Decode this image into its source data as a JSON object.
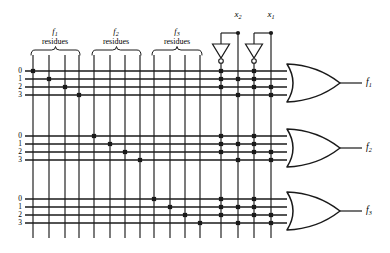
{
  "diagram": {
    "type": "logic-diagram",
    "width": 390,
    "height": 253,
    "line_color": "#1a1a1a",
    "background": "#ffffff"
  },
  "column_groups": [
    {
      "id": "f1-residues",
      "func_label": "f",
      "func_sub": "1",
      "caption": "residues",
      "brace_x1": 31,
      "brace_x2": 80,
      "label_cx": 55,
      "columns": [
        33,
        49,
        65,
        79
      ]
    },
    {
      "id": "f2-residues",
      "func_label": "f",
      "func_sub": "2",
      "caption": "residues",
      "brace_x1": 92,
      "brace_x2": 141,
      "label_cx": 116,
      "columns": [
        94,
        110,
        125,
        140
      ]
    },
    {
      "id": "f3-residues",
      "func_label": "f",
      "func_sub": "3",
      "caption": "residues",
      "brace_x1": 152,
      "brace_x2": 202,
      "label_cx": 177,
      "columns": [
        154,
        170,
        185,
        200
      ]
    }
  ],
  "input_columns": [
    {
      "id": "x2-bar",
      "x": 221,
      "label": "",
      "inverted": true
    },
    {
      "id": "x2",
      "x": 238,
      "label": "x",
      "sub": "2",
      "inverted": false
    },
    {
      "id": "x1-bar",
      "x": 254,
      "label": "",
      "inverted": true
    },
    {
      "id": "x1",
      "x": 271,
      "label": "x",
      "sub": "1",
      "inverted": false
    }
  ],
  "input_labels": [
    {
      "text": "x",
      "sub": "2",
      "x": 238,
      "y": 10
    },
    {
      "text": "x",
      "sub": "1",
      "x": 271,
      "y": 10
    }
  ],
  "inverters": [
    {
      "id": "inv-x2",
      "tap_x": 238,
      "tri_x": 221,
      "tap_y": 33,
      "top_y": 44,
      "bot_y": 58,
      "bubble_y": 61
    },
    {
      "id": "inv-x1",
      "tap_x": 271,
      "tri_x": 254,
      "tap_y": 33,
      "top_y": 44,
      "bot_y": 58,
      "bubble_y": 61
    }
  ],
  "bands": [
    {
      "id": "band-f1",
      "output": "f",
      "output_sub": "1",
      "row_labels": [
        "0",
        "1",
        "2",
        "3"
      ],
      "row_y": [
        71,
        79,
        87,
        95
      ],
      "gate_top": 64,
      "gate_bottom": 102,
      "residue_dots": [
        {
          "row": 0,
          "x": 33
        },
        {
          "row": 1,
          "x": 49
        },
        {
          "row": 2,
          "x": 65
        },
        {
          "row": 3,
          "x": 79
        }
      ],
      "input_dots": [
        {
          "row": 0,
          "x": 221
        },
        {
          "row": 0,
          "x": 254
        },
        {
          "row": 1,
          "x": 221
        },
        {
          "row": 1,
          "x": 238
        },
        {
          "row": 1,
          "x": 254
        },
        {
          "row": 2,
          "x": 221
        },
        {
          "row": 2,
          "x": 254
        },
        {
          "row": 2,
          "x": 271
        },
        {
          "row": 3,
          "x": 238
        },
        {
          "row": 3,
          "x": 271
        }
      ]
    },
    {
      "id": "band-f2",
      "output": "f",
      "output_sub": "2",
      "row_labels": [
        "0",
        "1",
        "2",
        "3"
      ],
      "row_y": [
        136,
        144,
        152,
        160
      ],
      "gate_top": 129,
      "gate_bottom": 167,
      "residue_dots": [
        {
          "row": 0,
          "x": 94
        },
        {
          "row": 1,
          "x": 110
        },
        {
          "row": 2,
          "x": 125
        },
        {
          "row": 3,
          "x": 140
        }
      ],
      "input_dots": [
        {
          "row": 0,
          "x": 221
        },
        {
          "row": 0,
          "x": 254
        },
        {
          "row": 1,
          "x": 221
        },
        {
          "row": 1,
          "x": 238
        },
        {
          "row": 1,
          "x": 254
        },
        {
          "row": 2,
          "x": 221
        },
        {
          "row": 2,
          "x": 254
        },
        {
          "row": 2,
          "x": 271
        },
        {
          "row": 3,
          "x": 238
        },
        {
          "row": 3,
          "x": 271
        }
      ]
    },
    {
      "id": "band-f3",
      "output": "f",
      "output_sub": "3",
      "row_labels": [
        "0",
        "1",
        "2",
        "3"
      ],
      "row_y": [
        199,
        207,
        215,
        223
      ],
      "gate_top": 192,
      "gate_bottom": 230,
      "residue_dots": [
        {
          "row": 0,
          "x": 154
        },
        {
          "row": 1,
          "x": 170
        },
        {
          "row": 2,
          "x": 185
        },
        {
          "row": 3,
          "x": 200
        }
      ],
      "input_dots": [
        {
          "row": 0,
          "x": 221
        },
        {
          "row": 0,
          "x": 254
        },
        {
          "row": 1,
          "x": 221
        },
        {
          "row": 1,
          "x": 238
        },
        {
          "row": 1,
          "x": 254
        },
        {
          "row": 2,
          "x": 221
        },
        {
          "row": 2,
          "x": 254
        },
        {
          "row": 2,
          "x": 271
        },
        {
          "row": 3,
          "x": 238
        },
        {
          "row": 3,
          "x": 271
        }
      ]
    }
  ],
  "geometry": {
    "row_line_x_start": 25,
    "row_line_x_end": 287,
    "col_line_y_top": 55,
    "col_line_y_bottom": 238,
    "gate_left": 287,
    "gate_right": 340,
    "output_stub_end": 362,
    "output_label_x": 366,
    "brace_y": 50,
    "dot_size": 4.2
  },
  "outputs": [
    {
      "id": "out-f1",
      "label": "f",
      "sub": "1",
      "y": 83
    },
    {
      "id": "out-f2",
      "label": "f",
      "sub": "2",
      "y": 148
    },
    {
      "id": "out-f3",
      "label": "f",
      "sub": "3",
      "y": 211
    }
  ]
}
